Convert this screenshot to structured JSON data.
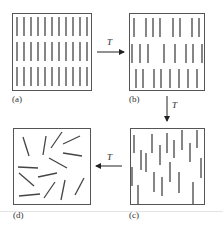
{
  "figure": {
    "panels": [
      {
        "id": "a",
        "label": "(a)",
        "state": "ordered rows (smectic-like), aligned vertical rods in 3 layers"
      },
      {
        "id": "b",
        "label": "(b)",
        "state": "layers with some vacancies, aligned vertical rods"
      },
      {
        "id": "c",
        "label": "(c)",
        "state": "aligned vertical rods, random positions (nematic-like)"
      },
      {
        "id": "d",
        "label": "(d)",
        "state": "random orientation and position (isotropic)"
      }
    ],
    "arrows": [
      {
        "from": "a",
        "to": "b",
        "label": "T",
        "direction": "right"
      },
      {
        "from": "b",
        "to": "c",
        "label": "T",
        "direction": "down"
      },
      {
        "from": "c",
        "to": "d",
        "label": "T",
        "direction": "left"
      }
    ]
  },
  "colors": {
    "line": "#555555",
    "rod": "#444444",
    "divider": "#dddddd"
  }
}
